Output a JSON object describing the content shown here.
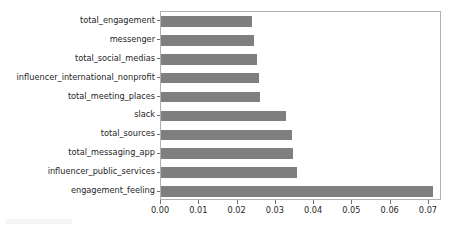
{
  "chart_data": {
    "type": "bar",
    "orientation": "horizontal",
    "title": "",
    "xlabel": "",
    "ylabel": "",
    "categories": [
      "total_engagement",
      "messenger",
      "total_social_medias",
      "influencer_international_nonprofit",
      "total_meeting_places",
      "slack",
      "total_sources",
      "total_messaging_app",
      "influencer_public_services",
      "engagement_feeling"
    ],
    "values": [
      0.0238,
      0.0243,
      0.0251,
      0.0256,
      0.0259,
      0.0327,
      0.0342,
      0.0345,
      0.0355,
      0.0711
    ],
    "xlim": [
      0.0,
      0.0734
    ],
    "xticks": [
      0.0,
      0.01,
      0.02,
      0.03,
      0.04,
      0.05,
      0.06,
      0.07
    ],
    "xticklabels": [
      "0.00",
      "0.01",
      "0.02",
      "0.03",
      "0.04",
      "0.05",
      "0.06",
      "0.07"
    ],
    "grid": false,
    "legend": null,
    "bar_color": "#7f7f7f",
    "frame_color": "#b0b0b0",
    "tick_color": "#262626",
    "background": "#ffffff"
  }
}
